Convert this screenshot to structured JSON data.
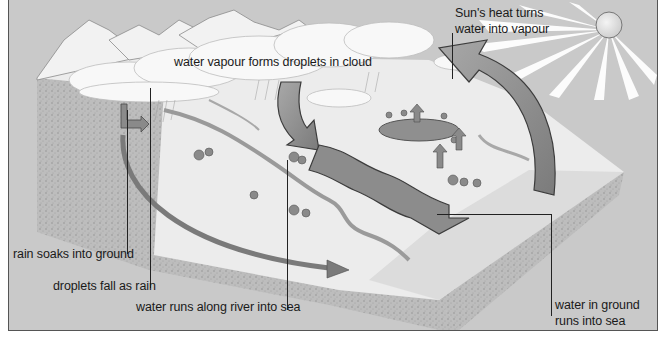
{
  "diagram": {
    "colors": {
      "background": "#c9c9c9",
      "frame_border": "#555555",
      "cloud": "#f8f8f8",
      "land": "#ececec",
      "ground_section": "#b5b5b5",
      "arrow": "#8a8a8a",
      "arrow_edge": "#4a4a4a",
      "river": "#9a9a9a",
      "sun": "#dedede"
    },
    "labels": {
      "sun_heat_line1": "Sun's heat turns",
      "sun_heat_line2": "water into vapour",
      "vapour_droplets": "water vapour forms droplets in cloud",
      "rain_soaks": "rain soaks into ground",
      "droplets_fall": "droplets fall as rain",
      "river_to_sea": "water runs along river into sea",
      "ground_to_sea_line1": "water in ground",
      "ground_to_sea_line2": "runs into sea"
    },
    "elements": [
      "mountains",
      "clouds",
      "sun",
      "evaporation-arrow",
      "condensation-arrow",
      "river-arrow",
      "groundwater-arrow",
      "lake",
      "river",
      "trees",
      "sea-block"
    ]
  }
}
